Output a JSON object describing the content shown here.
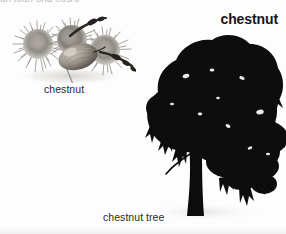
{
  "page": {
    "width": 286,
    "height": 234,
    "background_color": "#fdfdfd",
    "clipped_top_text": "un toon ond cosro"
  },
  "headword": {
    "text": "chestnut",
    "color": "#161616",
    "weight": "bold",
    "align": "right"
  },
  "figures": [
    {
      "id": "chestnut-burrs",
      "type": "photograph",
      "subject": "cluster of spiky chestnut burrs with a chestnut nut",
      "caption": "chestnut",
      "has_leader_line": true,
      "tone": "grayscale"
    },
    {
      "id": "chestnut-tree",
      "type": "photograph",
      "subject": "silhouette of a broad chestnut tree with dark canopy and trunk",
      "caption": "chestnut tree",
      "has_leader_line": false,
      "tone": "grayscale"
    }
  ],
  "captions": {
    "nut": "chestnut",
    "tree": "chestnut tree",
    "color": "#2b2b2b"
  },
  "icons": {
    "leader_line": "leader-line-icon"
  },
  "colors": {
    "background": "#fdfdfd",
    "text": "#2b2b2b",
    "headword": "#161616",
    "foliage_dark": "#0b0b0b",
    "foliage_mid": "#1c1c1c",
    "burr_mid": "#8d8a86",
    "burr_light": "#cfccc7",
    "rule": "#ededed"
  }
}
